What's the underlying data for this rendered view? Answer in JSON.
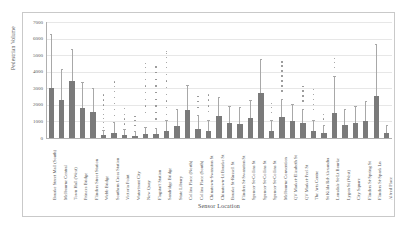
{
  "chart_data": {
    "type": "bar",
    "title": "",
    "xlabel": "Sensor Location",
    "ylabel": "Pedestrian Volume",
    "ylim": [
      0,
      7000
    ],
    "yticks": [
      0,
      1000,
      2000,
      3000,
      4000,
      5000,
      6000,
      7000
    ],
    "ytick_labels": [
      "0",
      "1000",
      "2000",
      "3000",
      "4000",
      "5000",
      "6000",
      "7000"
    ],
    "grid": true,
    "legend": "none",
    "bar_color": "#7a7a7a",
    "error_bar_color": "#a8a8a8",
    "outlier_color": "#8d8d8d",
    "categories": [
      "Bourke Street Mall (South)",
      "Melbourne Central",
      "Town Hall (West)",
      "Princes Bridge",
      "Flinders Street Station",
      "Webb Bridge",
      "Southern Cross Station",
      "Victoria Point",
      "Waterfront City",
      "New Quay",
      "Flagstaff Station",
      "Sandridge Bridge",
      "State Library",
      "Collins Place (North)",
      "Collins Place (South)",
      "Chinatown-Swanston St",
      "Chinatown-Lt Bourke St",
      "Bourke St-Russell St",
      "Flinders St-Swanston St",
      "Spencer St-Collins St",
      "Spencer St-Collins St",
      "Spencer St-Collins St",
      "Melbourne Convention",
      "QV Market-Elizabeth St",
      "QV Market-Peel St",
      "The Arts Centre",
      "St Kilda Rd-Alexandra",
      "Lonsdale St-Lt Bourke",
      "Lygon St (West)",
      "City Square",
      "Flinders St-Spring St",
      "Flinders St-Spark Ln",
      "Alfred Place"
    ],
    "bars": [
      {
        "label": "Bourke Street Mall (South)",
        "value": 3000,
        "err_low": 1200,
        "err_high": 6200,
        "outliers": []
      },
      {
        "label": "Melbourne Central",
        "value": 2300,
        "err_low": 900,
        "err_high": 4100,
        "outliers": []
      },
      {
        "label": "Town Hall (West)",
        "value": 3450,
        "err_low": 1400,
        "err_high": 5300,
        "outliers": []
      },
      {
        "label": "Princes Bridge",
        "value": 1800,
        "err_low": 700,
        "err_high": 3300,
        "outliers": []
      },
      {
        "label": "Flinders Street Station",
        "value": 1600,
        "err_low": 650,
        "err_high": 2950,
        "outliers": []
      },
      {
        "label": "Webb Bridge",
        "value": 180,
        "err_low": 60,
        "err_high": 420,
        "outliers": [
          600,
          900,
          1150,
          1400,
          1700,
          1950,
          2250,
          2550
        ]
      },
      {
        "label": "Southern Cross Station",
        "value": 320,
        "err_low": 120,
        "err_high": 900,
        "outliers": [
          1300,
          1700,
          2050,
          2400,
          2750,
          3050,
          3350
        ]
      },
      {
        "label": "Victoria Point",
        "value": 200,
        "err_low": 70,
        "err_high": 480,
        "outliers": [
          800,
          1100,
          1400,
          1750
        ]
      },
      {
        "label": "Waterfront City",
        "value": 150,
        "err_low": 50,
        "err_high": 350,
        "outliers": [
          700,
          1000,
          1250
        ]
      },
      {
        "label": "New Quay",
        "value": 260,
        "err_low": 90,
        "err_high": 620,
        "outliers": [
          1500,
          1900,
          2300,
          2700,
          3100,
          3500,
          3900,
          4200,
          4450
        ]
      },
      {
        "label": "Flagstaff Station",
        "value": 230,
        "err_low": 80,
        "err_high": 560,
        "outliers": [
          1100,
          1500,
          1900,
          2300,
          2700,
          3100,
          3500,
          3900,
          4250
        ]
      },
      {
        "label": "Sandridge Bridge",
        "value": 400,
        "err_low": 140,
        "err_high": 1050,
        "outliers": [
          1400,
          1800,
          2200,
          2600,
          3000,
          3400,
          3800,
          4200,
          4500,
          4800,
          5050,
          5200
        ]
      },
      {
        "label": "State Library",
        "value": 700,
        "err_low": 240,
        "err_high": 1700,
        "outliers": []
      },
      {
        "label": "Collins Place (North)",
        "value": 1700,
        "err_low": 600,
        "err_high": 3150,
        "outliers": []
      },
      {
        "label": "Collins Place (South)",
        "value": 560,
        "err_low": 190,
        "err_high": 1350,
        "outliers": [
          1800,
          2150,
          2450
        ]
      },
      {
        "label": "Chinatown-Swanston St",
        "value": 420,
        "err_low": 150,
        "err_high": 1000,
        "outliers": [
          1550,
          1900,
          2250,
          2550
        ]
      },
      {
        "label": "Chinatown-Lt Bourke St",
        "value": 1350,
        "err_low": 480,
        "err_high": 2400,
        "outliers": []
      },
      {
        "label": "Bourke St-Russell St",
        "value": 900,
        "err_low": 320,
        "err_high": 1900,
        "outliers": []
      },
      {
        "label": "Flinders St-Swanston St",
        "value": 830,
        "err_low": 290,
        "err_high": 1800,
        "outliers": []
      },
      {
        "label": "Spencer St-Collins St",
        "value": 1200,
        "err_low": 420,
        "err_high": 2250,
        "outliers": []
      },
      {
        "label": "Spencer St-Collins St",
        "value": 2700,
        "err_low": 950,
        "err_high": 4700,
        "outliers": []
      },
      {
        "label": "Spencer St-Collins St",
        "value": 430,
        "err_low": 150,
        "err_high": 1050,
        "outliers": [
          1500,
          1800,
          2050
        ]
      },
      {
        "label": "Melbourne Convention",
        "value": 1250,
        "err_low": 440,
        "err_high": 2300,
        "outliers": [
          2800,
          3100,
          3400,
          3700,
          4000,
          4300,
          4550
        ]
      },
      {
        "label": "QV Market-Elizabeth St",
        "value": 1050,
        "err_low": 370,
        "err_high": 2000,
        "outliers": []
      },
      {
        "label": "QV Market-Peel St",
        "value": 880,
        "err_low": 310,
        "err_high": 1700,
        "outliers": [
          2200,
          2500,
          2800,
          3050
        ]
      },
      {
        "label": "The Arts Centre",
        "value": 450,
        "err_low": 160,
        "err_high": 1050,
        "outliers": [
          1700,
          2000,
          2300,
          2600,
          2900
        ]
      },
      {
        "label": "St Kilda Rd-Alexandra",
        "value": 300,
        "err_low": 100,
        "err_high": 700,
        "outliers": [
          1100,
          1400
        ]
      },
      {
        "label": "Lonsdale St-Lt Bourke",
        "value": 1500,
        "err_low": 530,
        "err_high": 3700,
        "outliers": [
          4200,
          4500,
          4750
        ]
      },
      {
        "label": "Lygon St (West)",
        "value": 800,
        "err_low": 280,
        "err_high": 1700,
        "outliers": []
      },
      {
        "label": "City Square",
        "value": 900,
        "err_low": 320,
        "err_high": 1900,
        "outliers": []
      },
      {
        "label": "Flinders St-Spring St",
        "value": 1050,
        "err_low": 370,
        "err_high": 2150,
        "outliers": []
      },
      {
        "label": "Flinders St-Spark Ln",
        "value": 2550,
        "err_low": 900,
        "err_high": 5600,
        "outliers": []
      },
      {
        "label": "Alfred Place",
        "value": 300,
        "err_low": 100,
        "err_high": 700,
        "outliers": []
      }
    ]
  }
}
